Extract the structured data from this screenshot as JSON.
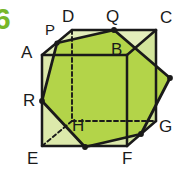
{
  "figure": {
    "exercise_number": "6",
    "exercise_number_color": "#76b72a",
    "colors": {
      "cross_section_fill": "#b3d449",
      "cube_face_fill": "#dce9ab",
      "outline": "#1a1a1a",
      "label_text": "#1a1a1a",
      "background": "#ffffff"
    },
    "stroke": {
      "solid_width": 2.6,
      "hidden_width": 1.9,
      "hidden_dash": "4 3"
    },
    "cube": {
      "name": "ABCDEFGH",
      "vertices": [
        {
          "id": "A",
          "label": "A",
          "x": 42,
          "y": 55,
          "hidden": false,
          "label_x": 21,
          "label_y": 44
        },
        {
          "id": "B",
          "label": "B",
          "x": 127,
          "y": 55,
          "hidden": false,
          "label_x": 111,
          "label_y": 41
        },
        {
          "id": "C",
          "label": "C",
          "x": 156,
          "y": 30,
          "hidden": false,
          "label_x": 160,
          "label_y": 9
        },
        {
          "id": "D",
          "label": "D",
          "x": 72,
          "y": 30,
          "hidden": false,
          "label_x": 62,
          "label_y": 8
        },
        {
          "id": "E",
          "label": "E",
          "x": 42,
          "y": 146,
          "hidden": false,
          "label_x": 27,
          "label_y": 150
        },
        {
          "id": "F",
          "label": "F",
          "x": 127,
          "y": 146,
          "hidden": false,
          "label_x": 122,
          "label_y": 150
        },
        {
          "id": "G",
          "label": "G",
          "x": 156,
          "y": 121,
          "hidden": false,
          "label_x": 159,
          "label_y": 118
        },
        {
          "id": "H",
          "label": "H",
          "x": 72,
          "y": 121,
          "hidden": true,
          "label_x": 72,
          "label_y": 117
        }
      ],
      "edges_visible": [
        [
          "A",
          "B"
        ],
        [
          "B",
          "F"
        ],
        [
          "F",
          "E"
        ],
        [
          "E",
          "A"
        ],
        [
          "B",
          "C"
        ],
        [
          "C",
          "G"
        ],
        [
          "G",
          "F"
        ],
        [
          "A",
          "D"
        ],
        [
          "D",
          "C"
        ]
      ],
      "edges_hidden": [
        [
          "D",
          "H"
        ],
        [
          "H",
          "E"
        ],
        [
          "H",
          "G"
        ]
      ]
    },
    "section": {
      "label": "hexagonal cross-section",
      "points": [
        {
          "id": "P",
          "label": "P",
          "x": 57,
          "y": 43,
          "on_edge": "AD",
          "labelled": true,
          "label_x": 45,
          "label_y": 22
        },
        {
          "id": "Q",
          "label": "Q",
          "x": 114,
          "y": 30,
          "on_edge": "DC",
          "labelled": true,
          "label_x": 106,
          "label_y": 8
        },
        {
          "id": "M1",
          "label": "",
          "x": 170,
          "y": 78,
          "on_edge": "CG",
          "labelled": false,
          "label_x": 0,
          "label_y": 0
        },
        {
          "id": "M2",
          "label": "",
          "x": 141,
          "y": 134,
          "on_edge": "GF",
          "labelled": false,
          "label_x": 0,
          "label_y": 0
        },
        {
          "id": "M3",
          "label": "",
          "x": 85,
          "y": 147,
          "on_edge": "FE",
          "labelled": false,
          "label_x": 0,
          "label_y": 0
        },
        {
          "id": "R",
          "label": "R",
          "x": 42,
          "y": 101,
          "on_edge": "AE",
          "labelled": true,
          "label_x": 23,
          "label_y": 92
        }
      ]
    }
  }
}
